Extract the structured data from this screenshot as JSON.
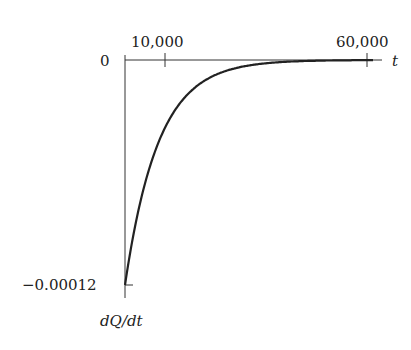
{
  "chart_data": {
    "type": "line",
    "title": "",
    "xlabel": "t",
    "ylabel": "dQ/dt",
    "x_ticks": [
      {
        "value": 10000,
        "label": "10,000"
      },
      {
        "value": 60000,
        "label": "60,000"
      }
    ],
    "y_ticks": [
      {
        "value": 0,
        "label": "0"
      },
      {
        "value": -0.00012,
        "label": "−0.00012"
      }
    ],
    "xlim": [
      0,
      63000
    ],
    "ylim": [
      -0.00012,
      0
    ],
    "grid": false,
    "legend": null,
    "series": [
      {
        "name": "dQ/dt",
        "description": "decaying exponential, approaching 0 from below",
        "x": [
          0,
          2500,
          5000,
          7500,
          10000,
          12500,
          15000,
          20000,
          25000,
          30000,
          40000,
          50000,
          60000
        ],
        "values": [
          -0.00012,
          -8.89e-05,
          -6.59e-05,
          -4.88e-05,
          -3.61e-05,
          -2.68e-05,
          -1.98e-05,
          -1.09e-05,
          -6e-06,
          -3.3e-06,
          -1e-06,
          -3e-07,
          -1e-07
        ]
      }
    ]
  },
  "labels": {
    "x_axis": "t",
    "y_axis": "dQ/dt",
    "x_tick_1": "10,000",
    "x_tick_2": "60,000",
    "y_tick_zero": "0",
    "y_tick_min": "−0.00012"
  }
}
